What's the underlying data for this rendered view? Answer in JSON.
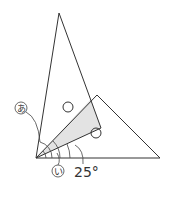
{
  "diagram": {
    "type": "geometry-angles",
    "labels": {
      "angle_a": "あ",
      "angle_i": "い",
      "given_angle": "25°"
    },
    "markers": {
      "circle_mark_count": 2,
      "meaning": "equal-angle markers (○)"
    },
    "colors": {
      "line": "#333333",
      "shade": "#e3e3e3",
      "background": "#ffffff"
    },
    "points": {
      "A": [
        36,
        158
      ],
      "tall_apex": [
        59,
        13
      ],
      "tall_right": [
        101,
        128
      ],
      "second_top": [
        97,
        95
      ],
      "second_right": [
        160,
        158
      ],
      "overlap_corner": [
        91,
        99
      ]
    }
  }
}
